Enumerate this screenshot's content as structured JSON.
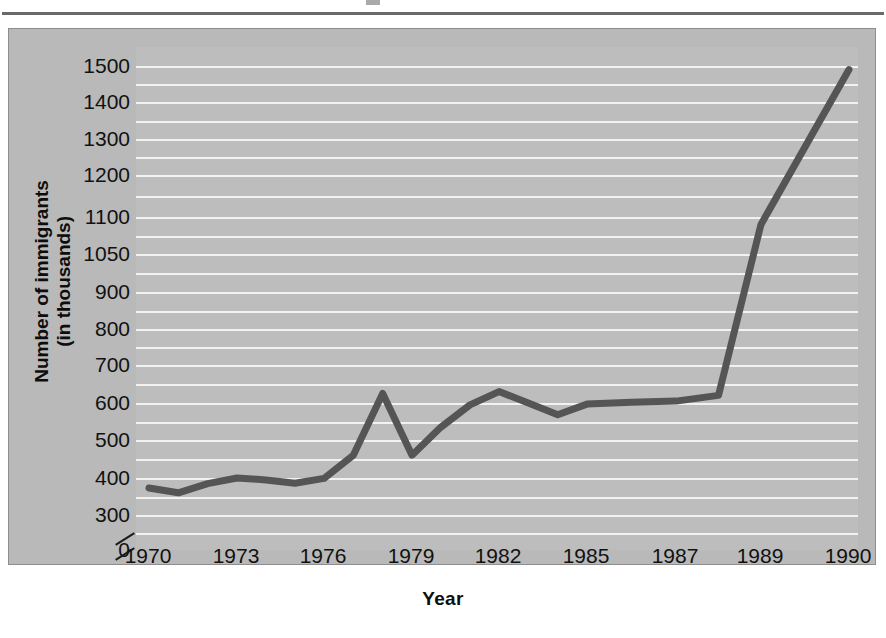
{
  "page": {
    "background_color": "#ffffff",
    "rule_color": "#6a6a6a"
  },
  "figure": {
    "panel_color": "#b9b9b9",
    "plot_color": "#bdbdbd",
    "gridline_color": "#f2f2f2",
    "line_color": "#555555",
    "border_color": "#8d8d8d"
  },
  "chart_data": {
    "type": "line",
    "title": "",
    "xlabel": "Year",
    "ylabel": "Number of immigrants (in thousands)",
    "ylabel_lines": [
      "Number of immigrants",
      "(in thousands)"
    ],
    "grid": true,
    "legend": "none",
    "axis_break": true,
    "axis_break_note": "y-axis broken between 0 and 300",
    "ytick_labels": [
      "1500",
      "1400",
      "1300",
      "1200",
      "1100",
      "1050",
      "900",
      "800",
      "700",
      "600",
      "500",
      "400",
      "300",
      "0"
    ],
    "ytick_values": [
      1500,
      1400,
      1300,
      1200,
      1100,
      1050,
      900,
      800,
      700,
      600,
      500,
      400,
      300,
      0
    ],
    "ylim": [
      0,
      1500
    ],
    "xtick_labels": [
      "1970",
      "1973",
      "1976",
      "1979",
      "1982",
      "1985",
      "1987",
      "1989",
      "1990"
    ],
    "xtick_values": [
      1970,
      1973,
      1976,
      1979,
      1982,
      1985,
      1987,
      1989,
      1990
    ],
    "xlim": [
      1970,
      1990
    ],
    "x": [
      1970,
      1971,
      1972,
      1973,
      1974,
      1975,
      1976,
      1977,
      1978,
      1979,
      1980,
      1981,
      1982,
      1983,
      1984,
      1985,
      1986,
      1987,
      1988,
      1989,
      1990
    ],
    "values": [
      373,
      360,
      385,
      400,
      395,
      386,
      399,
      460,
      625,
      460,
      535,
      595,
      630,
      600,
      568,
      597,
      602,
      605,
      620,
      1090,
      1490
    ],
    "series": [
      {
        "name": "Number of immigrants",
        "values": [
          373,
          360,
          385,
          400,
          395,
          386,
          399,
          460,
          625,
          460,
          535,
          595,
          630,
          600,
          568,
          597,
          602,
          605,
          620,
          1090,
          1490
        ]
      }
    ]
  }
}
